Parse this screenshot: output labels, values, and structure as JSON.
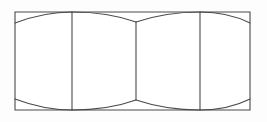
{
  "figure": {
    "type": "technical-line-drawing",
    "canvas": {
      "width": 267,
      "height": 122
    },
    "background_color": "#fdfdfd",
    "fill_color": "#ffffff",
    "line_color": "#4a4a4a",
    "line_width": 1.1
  },
  "geometry": {
    "outline": {
      "name": "body-rectangle",
      "left": 15,
      "top": 12,
      "right": 250,
      "bottom": 110,
      "width": 235,
      "height": 98,
      "path": "M 15 12 L 250 12 L 250 110 L 15 110 Z"
    },
    "dividers": [
      {
        "name": "flat-divider-left",
        "x": 72,
        "y_top": 12,
        "y_bottom": 110,
        "path": "M 72 12 L 72 110"
      },
      {
        "name": "flat-divider-center",
        "x": 136,
        "y_top": 22,
        "y_bottom": 100,
        "path": "M 136 22 L 136 100"
      },
      {
        "name": "flat-divider-right",
        "x": 200,
        "y_top": 12,
        "y_bottom": 110,
        "path": "M 200 12 L 200 110"
      }
    ],
    "arcs": [
      {
        "name": "chamfer-arc-top-left",
        "position": "top-left",
        "start": [
          15,
          23
        ],
        "end": [
          72,
          12
        ],
        "control": [
          44,
          12
        ],
        "path": "M 15 23 Q 44 12 72 12"
      },
      {
        "name": "chamfer-arc-top-center-left",
        "position": "top-center-left",
        "start": [
          72,
          12
        ],
        "end": [
          136,
          22
        ],
        "control": [
          108,
          12
        ],
        "path": "M 72 12 Q 108 12 136 22"
      },
      {
        "name": "chamfer-arc-top-center-right",
        "position": "top-center-right",
        "start": [
          136,
          22
        ],
        "end": [
          200,
          12
        ],
        "control": [
          166,
          12
        ],
        "path": "M 136 22 Q 166 12 200 12"
      },
      {
        "name": "chamfer-arc-top-right",
        "position": "top-right",
        "start": [
          200,
          12
        ],
        "end": [
          250,
          23
        ],
        "control": [
          228,
          12
        ],
        "path": "M 200 12 Q 228 12 250 23"
      },
      {
        "name": "chamfer-arc-bottom-left",
        "position": "bottom-left",
        "start": [
          15,
          99
        ],
        "end": [
          72,
          110
        ],
        "control": [
          44,
          110
        ],
        "path": "M 15 99 Q 44 110 72 110"
      },
      {
        "name": "chamfer-arc-bottom-center-left",
        "position": "bottom-center-left",
        "start": [
          72,
          110
        ],
        "end": [
          136,
          100
        ],
        "control": [
          108,
          110
        ],
        "path": "M 72 110 Q 108 110 136 100"
      },
      {
        "name": "chamfer-arc-bottom-center-right",
        "position": "bottom-center-right",
        "start": [
          136,
          100
        ],
        "end": [
          200,
          110
        ],
        "control": [
          166,
          110
        ],
        "path": "M 136 100 Q 166 110 200 110"
      },
      {
        "name": "chamfer-arc-bottom-right",
        "position": "bottom-right",
        "start": [
          200,
          110
        ],
        "end": [
          250,
          99
        ],
        "control": [
          228,
          110
        ],
        "path": "M 200 110 Q 228 110 250 99"
      }
    ]
  },
  "labels": {
    "visible_text": []
  }
}
